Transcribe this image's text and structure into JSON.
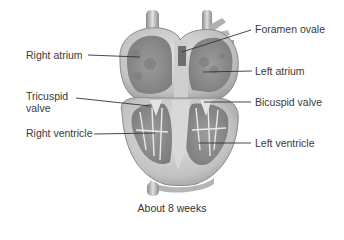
{
  "diagram": {
    "caption": "About 8 weeks",
    "labels": {
      "right_atrium": "Right atrium",
      "tricuspid_valve_line1": "Tricuspid",
      "tricuspid_valve_line2": "valve",
      "right_ventricle": "Right ventricle",
      "foramen_ovale": "Foramen ovale",
      "left_atrium": "Left atrium",
      "bicuspid_valve": "Bicuspid valve",
      "left_ventricle": "Left ventricle"
    },
    "colors": {
      "tissue_light": "#d4d4d4",
      "tissue_mid": "#a8a8a8",
      "tissue_dark": "#7a7a7a",
      "cavity": "#8e8e8e",
      "leader_line": "#333333",
      "text": "#3a3a3a"
    }
  }
}
